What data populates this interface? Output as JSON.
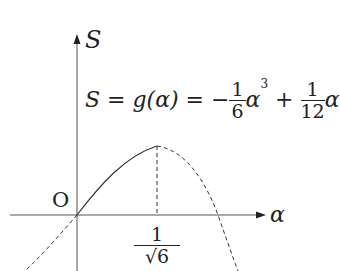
{
  "diagram": {
    "y_axis_label": "S",
    "x_axis_label": "α",
    "origin_label": "O",
    "formula": {
      "lhs": "S = g(α) =",
      "term1_sign": "−",
      "term1_num": "1",
      "term1_den": "6",
      "term1_var": "α",
      "term1_exp": "3",
      "plus": "+",
      "term2_num": "1",
      "term2_den": "12",
      "term2_var": "α"
    },
    "tick_label": {
      "num": "1",
      "den": "√6"
    },
    "colors": {
      "axis": "#555555",
      "curve": "#333333"
    }
  }
}
